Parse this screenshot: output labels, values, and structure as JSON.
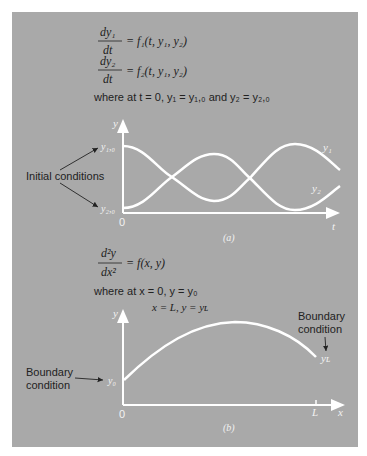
{
  "panel": {
    "background": "#a9a9a9",
    "curve_color": "#ffffff",
    "text_color": "#222222",
    "label_color": "#f2f2f2"
  },
  "part_a": {
    "equations": {
      "eq1": {
        "num": "dy₁",
        "den": "dt",
        "rhs": "= f₁(t, y₁, y₂)"
      },
      "eq2": {
        "num": "dy₂",
        "den": "dt",
        "rhs": "= f₂(t, y₁, y₂)"
      },
      "where": "where at t = 0, y₁ = y₁,₀ and y₂ = y₂,₀"
    },
    "annotation": "Initial conditions",
    "axis": {
      "y_label": "y",
      "x_label": "t",
      "origin": "0",
      "tick_y10": "y₁,₀",
      "tick_y20": "y₂,₀"
    },
    "series_labels": {
      "y1": "y₁",
      "y2": "y₂"
    },
    "caption": "(a)"
  },
  "part_b": {
    "equations": {
      "eq": {
        "num": "d²y",
        "den": "dx²",
        "rhs": "= f(x, y)"
      },
      "where_1": "where at  x = 0, y = y₀",
      "where_2": "x = L, y = yʟ"
    },
    "annotation_left": [
      "Boundary",
      "condition"
    ],
    "annotation_right": [
      "Boundary",
      "condition"
    ],
    "axis": {
      "y_label": "y",
      "x_label": "x",
      "origin": "0",
      "tick_y0": "y₀",
      "tick_L": "L",
      "end_label": "yʟ"
    },
    "caption": "(b)"
  }
}
